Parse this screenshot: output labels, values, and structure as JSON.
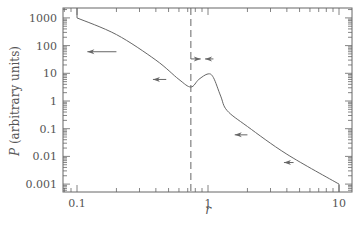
{
  "chart_data": {
    "type": "line",
    "title": "",
    "xlabel": "r",
    "ylabel": "P (arbitrary units)",
    "xscale": "log",
    "yscale": "log",
    "xlim": [
      0.085,
      11
    ],
    "ylim": [
      0.0007,
      1500
    ],
    "x_ticks": [
      0.1,
      1,
      10
    ],
    "x_tick_labels": [
      "0.1",
      "1",
      "10"
    ],
    "y_ticks": [
      1000,
      100,
      10,
      1,
      0.1,
      0.01,
      0.001
    ],
    "y_tick_labels": [
      "1000",
      "100",
      "10",
      "1",
      "0.1",
      "0.01",
      "0.001"
    ],
    "grid": false,
    "legend": null,
    "series": [
      {
        "name": "P(r)",
        "style": "solid",
        "points": [
          [
            0.1,
            1000
          ],
          [
            0.2,
            250
          ],
          [
            0.4,
            30
          ],
          [
            0.6,
            6
          ],
          [
            0.74,
            3.2
          ],
          [
            0.85,
            6
          ],
          [
            1.0,
            9.5
          ],
          [
            1.1,
            7
          ],
          [
            1.25,
            1.5
          ],
          [
            1.4,
            0.45
          ],
          [
            2,
            0.12
          ],
          [
            4,
            0.012
          ],
          [
            10,
            0.001
          ]
        ]
      }
    ],
    "annotations": [
      {
        "type": "vline",
        "x": 0.74,
        "style": "dashed"
      },
      {
        "type": "arrow",
        "direction": "left",
        "x_from": 0.2,
        "x_to": 0.12,
        "y": 60
      },
      {
        "type": "arrow",
        "direction": "left",
        "x_from": 0.48,
        "x_to": 0.38,
        "y": 6
      },
      {
        "type": "arrow",
        "direction": "right",
        "x_from": 0.74,
        "x_to": 0.88,
        "y": 33
      },
      {
        "type": "arrow",
        "direction": "left",
        "x_from": 1.1,
        "x_to": 0.95,
        "y": 33
      },
      {
        "type": "arrow",
        "direction": "left",
        "x_from": 2.0,
        "x_to": 1.6,
        "y": 0.06
      },
      {
        "type": "arrow",
        "direction": "left",
        "x_from": 4.5,
        "x_to": 3.8,
        "y": 0.006
      }
    ]
  }
}
